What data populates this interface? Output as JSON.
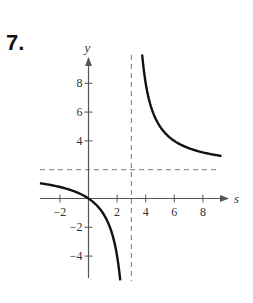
{
  "problem_number": "7.",
  "chart_data": {
    "type": "line",
    "title": "",
    "function": "y = 2s/(s-3)",
    "xlabel": "s",
    "ylabel": "y",
    "xlim": [
      -3.4,
      9.5
    ],
    "ylim": [
      -5.5,
      9.8
    ],
    "x_ticks": [
      -2,
      2,
      4,
      6,
      8
    ],
    "x_tick_labels": [
      "−2",
      "2",
      "4",
      "6",
      "8"
    ],
    "y_ticks": [
      -4,
      -2,
      4,
      6,
      8
    ],
    "y_tick_labels": [
      "−4",
      "−2",
      "4",
      "6",
      "8"
    ],
    "grid": false,
    "asymptotes": {
      "vertical": 3,
      "horizontal": 2
    },
    "series": [
      {
        "name": "left-branch",
        "x": [
          -3.4,
          -3,
          -2,
          -1,
          0,
          1,
          1.5,
          2,
          2.2,
          2.35
        ],
        "values": [
          1.06,
          1.0,
          0.8,
          0.5,
          0,
          -1,
          -2,
          -4,
          -5.5,
          -7.2
        ]
      },
      {
        "name": "right-branch",
        "x": [
          3.75,
          4,
          4.5,
          5,
          6,
          7,
          8,
          9.3
        ],
        "values": [
          10,
          8,
          6,
          5,
          4,
          3.5,
          3.2,
          2.95
        ]
      }
    ]
  }
}
